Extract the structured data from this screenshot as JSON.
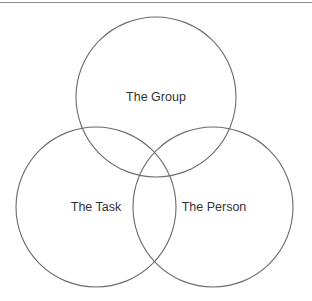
{
  "diagram": {
    "type": "venn",
    "title": "",
    "circles": [
      {
        "id": "group",
        "label": "The Group",
        "cx": 156,
        "cy": 97,
        "r": 80
      },
      {
        "id": "task",
        "label": "The Task",
        "cx": 96,
        "cy": 207,
        "r": 80
      },
      {
        "id": "person",
        "label": "The Person",
        "cx": 213,
        "cy": 207,
        "r": 80
      }
    ],
    "stroke_color": "#6b6b6b",
    "text_color": "#333333",
    "rule_color": "#8a8a8a"
  }
}
